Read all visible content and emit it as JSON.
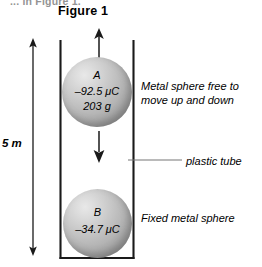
{
  "page": {
    "clipped_top_text": "... in Figure 1.",
    "figure_title": "Figure 1"
  },
  "dimension": {
    "label": "5 m",
    "icon": "double-headed-vertical-arrow"
  },
  "tube": {
    "name": "plastic tube",
    "callout_label": "plastic tube",
    "leader_icon": "leader-line"
  },
  "spheres": [
    {
      "id": "A",
      "name_label": "A",
      "charge_label": "–92.5 μC",
      "mass_label": "203 g",
      "annotation": "Metal sphere free to\nmove up and down",
      "annotation_line1": "Metal sphere free to",
      "annotation_line2": "move up and down",
      "motion_up_icon": "up-arrow",
      "motion_down_icon": "down-arrow"
    },
    {
      "id": "B",
      "name_label": "B",
      "charge_label": "–34.7 μC",
      "annotation": "Fixed metal sphere",
      "annotation_line1": "Fixed metal sphere"
    }
  ],
  "colors": {
    "line": "#1a1a1a",
    "sphere_light": "#e8e8e8",
    "sphere_dark": "#8c8c8c",
    "background": "#ffffff",
    "clipped_text": "#5a5a5a"
  }
}
